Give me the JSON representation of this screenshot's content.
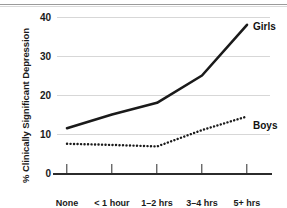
{
  "chart_data": {
    "type": "line",
    "title": "",
    "xlabel": "",
    "ylabel": "% Clinically Significant Depression",
    "categories": [
      "None",
      "< 1 hour",
      "1–2 hrs",
      "3–4 hrs",
      "5+ hrs"
    ],
    "series": [
      {
        "name": "Girls",
        "values": [
          11.5,
          15.0,
          18.0,
          25.0,
          38.0
        ],
        "style": "solid"
      },
      {
        "name": "Boys",
        "values": [
          7.5,
          7.2,
          6.8,
          11.0,
          14.5
        ],
        "style": "dotted"
      }
    ],
    "ylim": [
      0,
      40
    ],
    "yticks": [
      0,
      10,
      20,
      30,
      40
    ],
    "ytick_labels": [
      "0",
      "10",
      "20",
      "30",
      "40"
    ],
    "grid": "horizontal",
    "legend": "inline-end-labels",
    "colors": {
      "line": "#1a1a1a",
      "grid": "#d7d7d7",
      "axis": "#2b2b2b"
    }
  },
  "axis": {
    "y_title": "% Clinically Significant Depression",
    "y_labels": {
      "t0": "0",
      "t10": "10",
      "t20": "20",
      "t30": "30",
      "t40": "40"
    },
    "x_labels": {
      "c0": "None",
      "c1": "< 1 hour",
      "c2": "1–2 hrs",
      "c3": "3–4 hrs",
      "c4": "5+ hrs"
    }
  },
  "labels": {
    "girls": "Girls",
    "boys": "Boys"
  }
}
